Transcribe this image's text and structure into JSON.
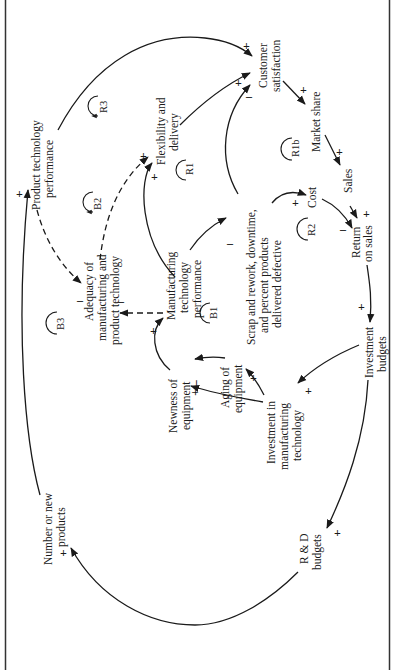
{
  "diagram": {
    "type": "causal-loop",
    "orientation": "rotated -90deg",
    "colors": {
      "ink": "#1a1a1a",
      "background": "#ffffff"
    },
    "nodes": {
      "product_tech_perf": [
        "Product technology",
        "performance"
      ],
      "flex_delivery": [
        "Flexibility and",
        "delivery"
      ],
      "customer_satisfaction": [
        "Customer",
        "satisfaction"
      ],
      "market_share": [
        "Market share"
      ],
      "sales": [
        "Sales"
      ],
      "cost": [
        "Cost"
      ],
      "return_on_sales": [
        "Return",
        "on sales"
      ],
      "investment_budgets": [
        "Investment",
        "budgets"
      ],
      "scrap": [
        "Scrap and rework, downtime,",
        "and percent products",
        "delivered defective"
      ],
      "mfg_tech_perf": [
        "Manufacturing",
        "technology",
        "performance"
      ],
      "adequacy": [
        "Adequacy of",
        "manufacturing and",
        "product technology"
      ],
      "newness": [
        "Newness of",
        "equipment"
      ],
      "aging": [
        "Aging of",
        "equipment"
      ],
      "investment_mfg": [
        "Investment in",
        "manufacturing",
        "technology"
      ],
      "rd_budgets": [
        "R & D",
        "budgets"
      ],
      "new_products": [
        "Number or new",
        "products"
      ]
    },
    "loops": {
      "R3": "R3",
      "B2": "B2",
      "R1": "R1",
      "R1b": "R1b",
      "R2": "R2",
      "B1": "B1",
      "B3": "B3"
    },
    "signs": {
      "plus": "+",
      "minus": "–",
      "plus_minus": "+ –"
    }
  }
}
